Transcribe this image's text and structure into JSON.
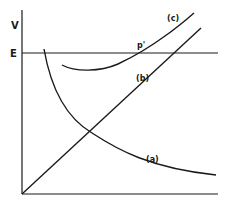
{
  "diagram": {
    "axes": {
      "y_label": "V",
      "level_label": "E"
    },
    "curves": [
      {
        "id": "a",
        "label": "(a)",
        "description": "decreasing curve"
      },
      {
        "id": "b",
        "label": "(b)",
        "description": "straight line through origin"
      },
      {
        "id": "c",
        "label": "(c)",
        "description": "curve with minimum, rising"
      }
    ],
    "points": [
      {
        "id": "p_prime",
        "label": "p'",
        "description": "intersection of curve (c) with level E"
      }
    ],
    "colors": {
      "ink": "#1a1a1a",
      "background": "#ffffff"
    }
  }
}
